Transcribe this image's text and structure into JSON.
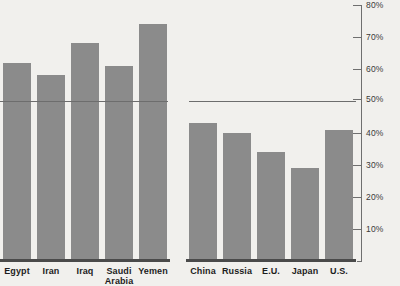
{
  "chart_data": {
    "type": "bar",
    "title": "",
    "subtitle": "",
    "xlabel": "",
    "ylabel": "",
    "ylim": [
      0,
      80
    ],
    "grid": false,
    "legend": null,
    "yticks": [
      "10%",
      "20%",
      "30%",
      "40%",
      "50%",
      "60%",
      "70%",
      "80%"
    ],
    "ytick_values": [
      10,
      20,
      30,
      40,
      50,
      60,
      70,
      80
    ],
    "annotations": [
      {
        "name": "fifty-percent-reference-line",
        "value": 50,
        "label": ""
      }
    ],
    "groups": [
      {
        "name": "left-group",
        "categories": [
          "Egypt",
          "Iran",
          "Iraq",
          "Saudi Arabia",
          "Yemen"
        ],
        "values": [
          62,
          58,
          68,
          61,
          74
        ]
      },
      {
        "name": "right-group",
        "categories": [
          "China",
          "Russia",
          "E.U.",
          "Japan",
          "U.S."
        ],
        "values": [
          43,
          40,
          34,
          29,
          41
        ]
      }
    ],
    "categories": [
      "Egypt",
      "Iran",
      "Iraq",
      "Saudi Arabia",
      "Yemen",
      "China",
      "Russia",
      "E.U.",
      "Japan",
      "U.S."
    ],
    "values": [
      62,
      58,
      68,
      61,
      74,
      43,
      40,
      34,
      29,
      41
    ],
    "colors": {
      "bar": "#8b8b8b",
      "background": "#f1f0ed",
      "axis": "#6f6f6f",
      "reference_line": "#6d6d6d",
      "baseline": "#4a4a4a",
      "label_text": "#1d1d1d",
      "tick_text": "#3a3a3a"
    }
  },
  "labels": {
    "egypt": "Egypt",
    "iran": "Iran",
    "iraq": "Iraq",
    "saudi_line1": "Saudi",
    "saudi_line2": "Arabia",
    "yemen": "Yemen",
    "china": "China",
    "russia": "Russia",
    "eu": "E.U.",
    "japan": "Japan",
    "us": "U.S."
  },
  "ticks": {
    "t10": "10%",
    "t20": "20%",
    "t30": "30%",
    "t40": "40%",
    "t50": "50%",
    "t60": "60%",
    "t70": "70%",
    "t80": "80%"
  }
}
